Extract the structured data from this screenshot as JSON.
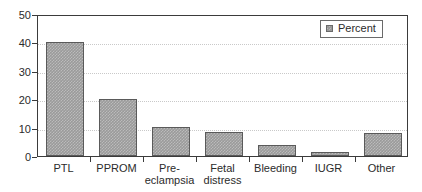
{
  "chart_data": {
    "type": "bar",
    "title": "",
    "subtitle": "",
    "xlabel": "",
    "ylabel": "",
    "categories": [
      "PTL",
      "PPROM",
      "Pre-\neclampsia",
      "Fetal\ndistress",
      "Bleeding",
      "IUGR",
      "Other"
    ],
    "values": [
      40.0,
      20.2,
      10.3,
      8.3,
      3.8,
      1.5,
      8.2
    ],
    "series": [
      {
        "name": "Percent",
        "values": [
          40.0,
          20.2,
          10.3,
          8.3,
          3.8,
          1.5,
          8.2
        ]
      }
    ],
    "ylim": [
      0,
      50
    ],
    "ytick_labels": [
      "0",
      "10",
      "20",
      "30",
      "40",
      "50"
    ],
    "ytick_values": [
      0,
      10,
      20,
      30,
      40,
      50
    ],
    "grid": "horizontal-dotted",
    "gridline_values": [
      10,
      20,
      30,
      40
    ],
    "legend": {
      "position": "top-right",
      "entries": [
        {
          "label": "Percent",
          "color": "#9a9a9a"
        }
      ]
    },
    "colors": {
      "bar_fill": "#9a9a9a",
      "bar_border": "#5a5a5a",
      "axis": "#3b3b3b",
      "grid": "#c9c9c9",
      "text": "#2b2b2b",
      "background": "#ffffff"
    }
  }
}
